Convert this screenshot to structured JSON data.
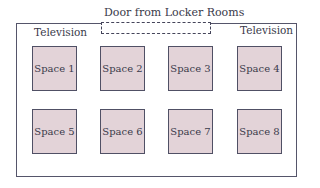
{
  "door": {
    "label": "Door from Locker Rooms"
  },
  "televisions": [
    {
      "label": "Television"
    },
    {
      "label": "Television"
    }
  ],
  "spaces": [
    {
      "label": "Space 1"
    },
    {
      "label": "Space 2"
    },
    {
      "label": "Space 3"
    },
    {
      "label": "Space 4"
    },
    {
      "label": "Space 5"
    },
    {
      "label": "Space 6"
    },
    {
      "label": "Space 7"
    },
    {
      "label": "Space 8"
    }
  ],
  "colors": {
    "space_fill": "#e3d3d8",
    "border": "#505065"
  }
}
